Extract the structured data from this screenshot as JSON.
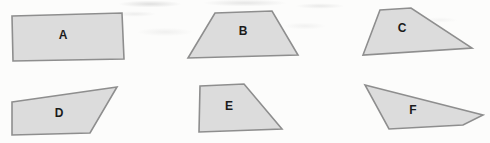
{
  "figure": {
    "shapes": [
      {
        "label": "A",
        "type": "rectangle"
      },
      {
        "label": "B",
        "type": "trapezoid"
      },
      {
        "label": "C",
        "type": "irregular-quadrilateral"
      },
      {
        "label": "D",
        "type": "irregular-quadrilateral"
      },
      {
        "label": "E",
        "type": "right-trapezoid"
      },
      {
        "label": "F",
        "type": "irregular-quadrilateral"
      }
    ],
    "colors": {
      "shape_fill": "#dcdcdc",
      "shape_stroke": "#8e8e8e",
      "label_text": "#1b1b1b",
      "background": "#fcfcfb"
    }
  }
}
